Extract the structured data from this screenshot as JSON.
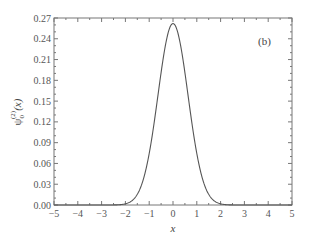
{
  "chart_data": {
    "type": "line",
    "title": "",
    "panel_label": "(b)",
    "xlabel": "x",
    "ylabel": "ψ0(2)(x)",
    "ylabel_parts": {
      "symbol": "ψ",
      "subscript": "0",
      "superscript": "(2)",
      "arg": "(x)"
    },
    "xlim": [
      -5,
      5
    ],
    "ylim": [
      0,
      0.27
    ],
    "xticks": [
      -5,
      -4,
      -3,
      -2,
      -1,
      0,
      1,
      2,
      3,
      4,
      5
    ],
    "xtick_labels": [
      "−5",
      "−4",
      "−3",
      "−2",
      "−1",
      "0",
      "1",
      "2",
      "3",
      "4",
      "5"
    ],
    "yticks": [
      0.0,
      0.03,
      0.06,
      0.09,
      0.12,
      0.15,
      0.18,
      0.21,
      0.24,
      0.27
    ],
    "ytick_labels": [
      "0.00",
      "0.03",
      "0.06",
      "0.09",
      "0.12",
      "0.15",
      "0.18",
      "0.21",
      "0.24",
      "0.27"
    ],
    "grid": false,
    "legend": null,
    "series": [
      {
        "name": "ψ0(2)(x)",
        "color": "#555555",
        "x": [
          -5,
          -4,
          -3,
          -2.5,
          -2,
          -1.75,
          -1.5,
          -1.25,
          -1,
          -0.75,
          -0.5,
          -0.25,
          0,
          0.25,
          0.5,
          0.75,
          1,
          1.25,
          1.5,
          1.75,
          2,
          2.5,
          3,
          4,
          5
        ],
        "y": [
          0.0,
          0.0,
          0.0,
          0.0001,
          0.0017,
          0.0055,
          0.015,
          0.0361,
          0.0746,
          0.1288,
          0.1903,
          0.2396,
          0.262,
          0.2396,
          0.1903,
          0.1288,
          0.0746,
          0.0361,
          0.015,
          0.0055,
          0.0017,
          0.0001,
          0.0,
          0.0,
          0.0
        ]
      }
    ]
  }
}
